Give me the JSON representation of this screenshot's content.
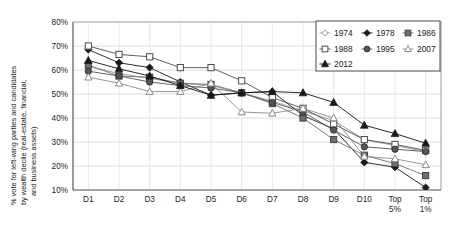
{
  "chart_data": {
    "type": "line",
    "title": "",
    "xlabel": "",
    "ylabel": "% vote for left-wing parties and candidates by wealth decile (real-estate, financial, and business assets)",
    "ylabel_lines": [
      "% vote for left-wing parties and candidates",
      "by wealth decile (real-estate, financial,",
      "and business assets)"
    ],
    "categories": [
      "D1",
      "D2",
      "D3",
      "D4",
      "D5",
      "D6",
      "D7",
      "D8",
      "D9",
      "D10",
      "Top 5%",
      "Top 1%"
    ],
    "category_labels": [
      {
        "line1": "D1",
        "line2": ""
      },
      {
        "line1": "D2",
        "line2": ""
      },
      {
        "line1": "D3",
        "line2": ""
      },
      {
        "line1": "D4",
        "line2": ""
      },
      {
        "line1": "D5",
        "line2": ""
      },
      {
        "line1": "D6",
        "line2": ""
      },
      {
        "line1": "D7",
        "line2": ""
      },
      {
        "line1": "D8",
        "line2": ""
      },
      {
        "line1": "D9",
        "line2": ""
      },
      {
        "line1": "D10",
        "line2": ""
      },
      {
        "line1": "Top",
        "line2": "5%"
      },
      {
        "line1": "Top",
        "line2": "1%"
      }
    ],
    "ylim": [
      10,
      80
    ],
    "yticks": [
      10,
      20,
      30,
      40,
      50,
      60,
      70,
      80
    ],
    "ytick_labels": [
      "10%",
      "20%",
      "30%",
      "40%",
      "50%",
      "60%",
      "70%",
      "80%"
    ],
    "grid": true,
    "legend_position": "top-right",
    "series": [
      {
        "name": "1974",
        "marker": "open-diamond",
        "color": "#9a9a9a",
        "values": [
          61.5,
          58.5,
          56.5,
          54.5,
          53.5,
          50.5,
          47.0,
          43.0,
          39.0,
          31.0,
          28.5,
          26.0
        ]
      },
      {
        "name": "1978",
        "marker": "filled-diamond",
        "color": "#1a1a1a",
        "values": [
          68.5,
          63.0,
          61.0,
          55.0,
          49.5,
          50.5,
          51.0,
          41.0,
          35.5,
          21.5,
          19.5,
          11.0
        ]
      },
      {
        "name": "1986",
        "marker": "filled-square-grey",
        "color": "#6e6e6e",
        "values": [
          62.0,
          57.5,
          57.0,
          54.5,
          54.0,
          50.5,
          46.0,
          40.0,
          31.0,
          24.5,
          21.0,
          16.0
        ]
      },
      {
        "name": "1988",
        "marker": "open-square",
        "color": "#4d4d4d",
        "values": [
          70.0,
          66.5,
          65.5,
          61.0,
          61.0,
          55.5,
          48.5,
          44.0,
          37.5,
          31.0,
          29.0,
          26.5
        ]
      },
      {
        "name": "1995",
        "marker": "filled-circle",
        "color": "#555555",
        "values": [
          59.5,
          57.5,
          55.0,
          53.5,
          52.5,
          50.5,
          46.5,
          42.5,
          35.0,
          28.0,
          27.0,
          26.0
        ]
      },
      {
        "name": "2007",
        "marker": "open-triangle",
        "color": "#8a8a8a",
        "values": [
          57.0,
          54.5,
          51.0,
          51.0,
          54.5,
          42.5,
          42.0,
          44.0,
          40.0,
          24.0,
          23.0,
          20.5
        ]
      },
      {
        "name": "2012",
        "marker": "filled-triangle",
        "color": "#111111",
        "values": [
          64.0,
          60.5,
          57.5,
          53.5,
          49.5,
          50.5,
          51.0,
          50.5,
          46.5,
          37.0,
          33.5,
          29.5
        ]
      }
    ],
    "legend_entries": [
      {
        "label": "1974",
        "marker": "open-diamond"
      },
      {
        "label": "1978",
        "marker": "filled-diamond"
      },
      {
        "label": "1986",
        "marker": "filled-square-grey"
      },
      {
        "label": "1988",
        "marker": "open-square"
      },
      {
        "label": "1995",
        "marker": "filled-circle"
      },
      {
        "label": "2007",
        "marker": "open-triangle"
      },
      {
        "label": "2012",
        "marker": "filled-triangle"
      }
    ]
  }
}
